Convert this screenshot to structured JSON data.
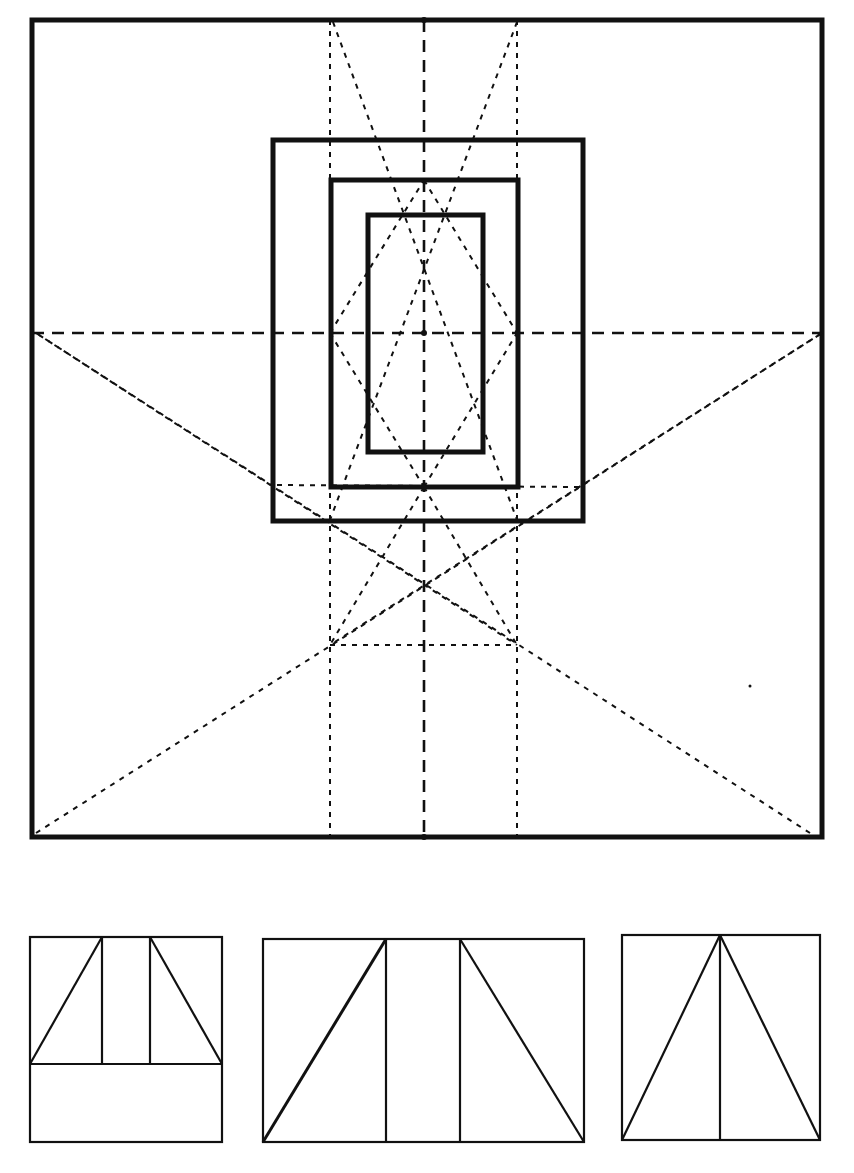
{
  "diagram": {
    "title": "",
    "colors": {
      "ink": "#111111",
      "paper": "#ffffff"
    },
    "main_square": {
      "x1": 32,
      "y1": 20,
      "x2": 822,
      "y2": 837
    },
    "center": {
      "x": 424,
      "y": 333
    },
    "nested_rects": [
      {
        "name": "outer-frame",
        "x1": 273,
        "y1": 140,
        "x2": 583,
        "y2": 521
      },
      {
        "name": "middle-frame",
        "x1": 331,
        "y1": 180,
        "x2": 518,
        "y2": 487
      },
      {
        "name": "inner-frame",
        "x1": 368,
        "y1": 215,
        "x2": 483,
        "y2": 452
      }
    ],
    "guide_verticals_x": [
      330,
      424,
      517
    ],
    "guide_horizontal_y": 333,
    "lower_horizontal_guide": {
      "x1": 330,
      "x2": 517,
      "y": 645
    },
    "panels": [
      {
        "name": "panel-left",
        "x1": 30,
        "y1": 937,
        "x2": 222,
        "y2": 1142,
        "mid_y": 1064,
        "verticals_x": [
          102,
          150
        ]
      },
      {
        "name": "panel-center",
        "x1": 263,
        "y1": 939,
        "x2": 584,
        "y2": 1142,
        "verticals_x": [
          386,
          460
        ]
      },
      {
        "name": "panel-right",
        "x1": 622,
        "y1": 935,
        "x2": 820,
        "y2": 1140,
        "apex_x": 720
      }
    ]
  }
}
